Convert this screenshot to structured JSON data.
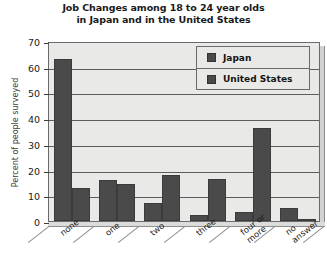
{
  "chart_data": {
    "type": "bar",
    "title": "Job Changes among 18 to 24 year olds in Japan and in the United States",
    "title_lines": [
      "Job Changes among 18 to 24 year olds",
      "in Japan and in the United States"
    ],
    "xlabel": "",
    "ylabel": "Percent of people surveyed",
    "ylim": [
      0,
      70
    ],
    "ytick_step": 10,
    "yticks": [
      0,
      10,
      20,
      30,
      40,
      50,
      60,
      70
    ],
    "ytick_labels": [
      "0",
      "10",
      "20",
      "30",
      "40",
      "50",
      "60",
      "70"
    ],
    "grid": true,
    "legend_position": "top-right",
    "categories": [
      "none",
      "one",
      "two",
      "three",
      "four or more",
      "no answer"
    ],
    "category_label_lines": [
      [
        "none"
      ],
      [
        "one"
      ],
      [
        "two"
      ],
      [
        "three"
      ],
      [
        "four or",
        "more"
      ],
      [
        "no",
        "answer"
      ]
    ],
    "series": [
      {
        "name": "Japan",
        "color": "#4a4a4a",
        "values": [
          63,
          16,
          7,
          2.5,
          3.5,
          5
        ]
      },
      {
        "name": "United States",
        "color": "#4a4a4a",
        "values": [
          13,
          14.5,
          18,
          16.5,
          36,
          0.5
        ]
      }
    ]
  },
  "colors": {
    "bar": "#4a4a4a",
    "plot_background": "#e9e9e7",
    "grid": "#5d5d5d",
    "axis": "#3c3c3c",
    "page_background": "#ffffff",
    "text": "#1a1a1a"
  },
  "legend": {
    "items": [
      {
        "label": "Japan"
      },
      {
        "label": "United States"
      }
    ]
  }
}
